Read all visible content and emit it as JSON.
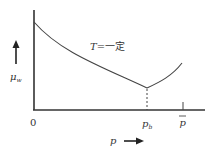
{
  "diagram": {
    "type": "line-sketch",
    "curve_label": "T=一定",
    "curve_label_var": "T",
    "curve_label_rest": "=一定",
    "y_axis": {
      "label": "μ",
      "label_sub": "w",
      "direction": "up"
    },
    "x_axis": {
      "label": "p",
      "direction": "right"
    },
    "origin_label": "0",
    "ticks": [
      {
        "label": "p",
        "sub": "b",
        "style": "dashed-drop"
      },
      {
        "label": "p",
        "overline": true,
        "style": "tick-mark"
      }
    ],
    "colors": {
      "line": "#333333",
      "background": "#ffffff"
    }
  }
}
